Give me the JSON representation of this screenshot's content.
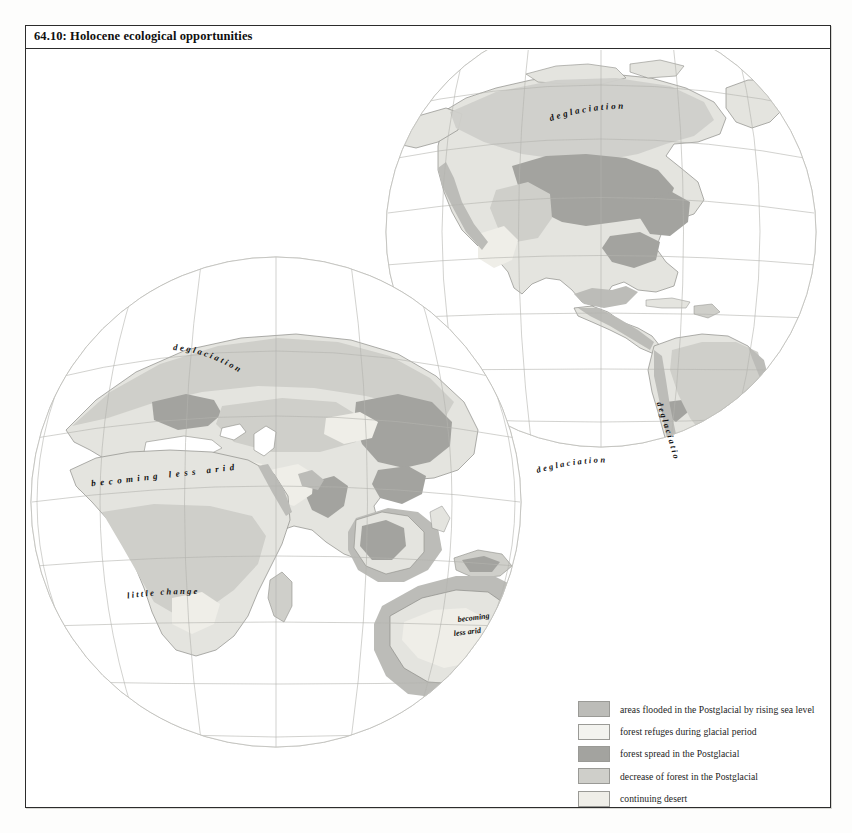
{
  "plate": {
    "number": "64.10",
    "title": "64.10: Holocene ecological opportunities"
  },
  "legend": {
    "items": [
      {
        "label": "areas flooded in the Postglacial by rising sea level",
        "color": "#bcbcb8",
        "key": "flooded"
      },
      {
        "label": "forest refuges during glacial period",
        "color": "#f0f0ec",
        "key": "refuge"
      },
      {
        "label": "forest spread in the Postglacial",
        "color": "#a3a39f",
        "key": "spread"
      },
      {
        "label": "decrease of forest in the Postglacial",
        "color": "#cfcfca",
        "key": "decrease"
      },
      {
        "label": "continuing desert",
        "color": "#eceae4",
        "key": "desert"
      }
    ]
  },
  "map": {
    "projection": "orthographic",
    "globes": [
      {
        "name": "western-hemisphere",
        "center_lon": -90,
        "center_lat": 25,
        "cx": 575,
        "cy": 230,
        "r": 215
      },
      {
        "name": "eastern-hemisphere",
        "center_lon": 60,
        "center_lat": 20,
        "cx": 275,
        "cy": 500,
        "r": 245
      }
    ],
    "graticule_step_deg": 20,
    "labels": [
      {
        "text": "deglaciation",
        "region": "north-america",
        "style": "arc"
      },
      {
        "text": "deglaciation",
        "region": "patagonia",
        "style": "vertical"
      },
      {
        "text": "deglaciation",
        "region": "southern-ocean-west",
        "style": "arc"
      },
      {
        "text": "deglaciation",
        "region": "northern-eurasia",
        "style": "arc"
      },
      {
        "text": "becoming less arid",
        "region": "sahara-arabia",
        "style": "arc"
      },
      {
        "text": "little change",
        "region": "southern-africa",
        "style": "arc"
      },
      {
        "text": "becoming",
        "region": "australia-line1",
        "style": "straight"
      },
      {
        "text": "less arid",
        "region": "australia-line2",
        "style": "straight"
      }
    ]
  },
  "colors": {
    "land_base": "#e4e4df",
    "flooded": "#bcbcb8",
    "refuge": "#f4f4f0",
    "spread": "#a3a39f",
    "decrease": "#cfcfca",
    "desert": "#efeee8",
    "coast": "#8d8d88",
    "graticule": "#b3b3ae",
    "globe_edge": "#c4c4bf",
    "frame": "#2c2c2c",
    "text": "#111111"
  }
}
